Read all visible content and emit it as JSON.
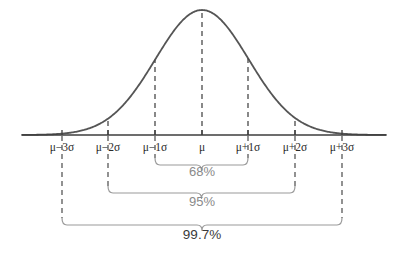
{
  "figure": {
    "background_color": "#ffffff",
    "width": 403,
    "height": 256
  },
  "colors": {
    "curve": "#555555",
    "axis": "#3d3d3d",
    "dashed_line": "#4a4a4a",
    "brace": "#9a9a9a",
    "tick_label_text": "#2b2b2b",
    "percent_label_gray": "#8a8a8a",
    "percent_label_dark": "#3a3a3a"
  },
  "axis": {
    "name": "horizontal-axis",
    "x_start": 22,
    "x_end": 386,
    "y": 135,
    "ticks": [
      {
        "label": "μ−3σ",
        "x": 62,
        "sigma": -3
      },
      {
        "label": "μ−2σ",
        "x": 108,
        "sigma": -2
      },
      {
        "label": "μ−1σ",
        "x": 155,
        "sigma": -1
      },
      {
        "label": "μ",
        "x": 202,
        "sigma": 0
      },
      {
        "label": "μ+1σ",
        "x": 248,
        "sigma": 1
      },
      {
        "label": "μ+2σ",
        "x": 295,
        "sigma": 2
      },
      {
        "label": "μ+3σ",
        "x": 342,
        "sigma": 3
      }
    ],
    "tick_label_y": 151
  },
  "curve": {
    "name": "bell-curve",
    "peak_x": 202,
    "peak_y": 10,
    "baseline_y": 135,
    "sigma_px": 46.6,
    "stroke_width": 1.8
  },
  "dashed_lines": [
    {
      "name": "dashed-line-minus-2-sigma",
      "x": 108,
      "sigma": -2,
      "top_y": 62.5
    },
    {
      "name": "dashed-line-minus-1-sigma",
      "x": 155,
      "sigma": -1,
      "top_y": 30.8
    },
    {
      "name": "dashed-line-mu",
      "x": 202,
      "sigma": 0,
      "top_y": 10.0
    },
    {
      "name": "dashed-line-plus-1-sigma",
      "x": 248,
      "sigma": 1,
      "top_y": 30.8
    },
    {
      "name": "dashed-line-plus-2-sigma",
      "x": 295,
      "sigma": 2,
      "top_y": 62.5
    }
  ],
  "drop_lines": [
    {
      "name": "drop-line-minus-3-sigma",
      "x": 62,
      "y_top": 136,
      "y_bottom": 218
    },
    {
      "name": "drop-line-minus-2-sigma",
      "x": 108,
      "y_top": 136,
      "y_bottom": 186
    },
    {
      "name": "drop-line-minus-1-sigma",
      "x": 155,
      "y_top": 136,
      "y_bottom": 158
    },
    {
      "name": "drop-line-plus-1-sigma",
      "x": 248,
      "y_top": 136,
      "y_bottom": 158
    },
    {
      "name": "drop-line-plus-2-sigma",
      "x": 295,
      "y_top": 136,
      "y_bottom": 186
    },
    {
      "name": "drop-line-plus-3-sigma",
      "x": 342,
      "y_top": 136,
      "y_bottom": 218
    }
  ],
  "intervals": [
    {
      "name": "interval-68",
      "label": "68%",
      "label_color": "#8a8a8a",
      "x_left": 155,
      "x_right": 248,
      "brace_y": 158,
      "label_x": 202,
      "label_y": 176,
      "range": "μ±1σ"
    },
    {
      "name": "interval-95",
      "label": "95%",
      "label_color": "#8a8a8a",
      "x_left": 108,
      "x_right": 295,
      "brace_y": 186,
      "label_x": 202,
      "label_y": 206,
      "range": "μ±2σ"
    },
    {
      "name": "interval-997",
      "label": "99.7%",
      "label_color": "#3a3a3a",
      "x_left": 62,
      "x_right": 342,
      "brace_y": 218,
      "label_x": 202,
      "label_y": 239,
      "range": "μ±3σ"
    }
  ],
  "chart_data": {
    "type": "line",
    "title": "",
    "xlabel": "",
    "ylabel": "",
    "distribution": "normal",
    "x_tick_labels": [
      "μ−3σ",
      "μ−2σ",
      "μ−1σ",
      "μ",
      "μ+1σ",
      "μ+2σ",
      "μ+3σ"
    ],
    "x": [
      -3,
      -2,
      -1,
      0,
      1,
      2,
      3
    ],
    "xlim": [
      -3.9,
      3.95
    ],
    "ylim": [
      0,
      1
    ],
    "grid": false,
    "legend": null,
    "series": [
      {
        "name": "standard normal pdf (normalized to peak 1)",
        "values": [
          0.0111,
          0.1353,
          0.6065,
          1.0,
          0.6065,
          0.1353,
          0.0111
        ]
      }
    ],
    "annotations": [
      {
        "text": "68%",
        "interval_sigma": [
          -1,
          1
        ],
        "coverage_percent": 68
      },
      {
        "text": "95%",
        "interval_sigma": [
          -2,
          2
        ],
        "coverage_percent": 95
      },
      {
        "text": "99.7%",
        "interval_sigma": [
          -3,
          3
        ],
        "coverage_percent": 99.7
      }
    ]
  }
}
